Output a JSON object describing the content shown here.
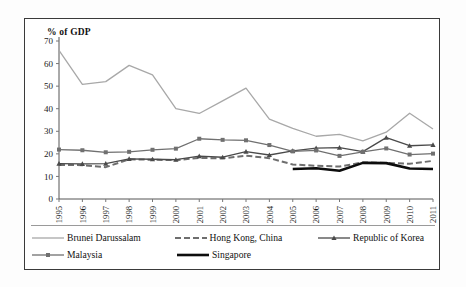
{
  "figure": {
    "axis_title": "% of GDP",
    "border_color": "#3a3a3a",
    "background": "#ffffff"
  },
  "chart_data": {
    "type": "line",
    "title": "",
    "subtitle": "",
    "xlabel": "",
    "ylabel": "% of GDP",
    "ylim": [
      0,
      70
    ],
    "ytick_step": 10,
    "yticks": [
      0,
      10,
      20,
      30,
      40,
      50,
      60,
      70
    ],
    "grid": false,
    "legend_position": "bottom",
    "categories": [
      "1995",
      "1996",
      "1997",
      "1998",
      "1999",
      "2000",
      "2001",
      "2002",
      "2003",
      "2004",
      "2005",
      "2006",
      "2007",
      "2008",
      "2009",
      "2010",
      "2011"
    ],
    "series": [
      {
        "name": "Brunei Darussalam",
        "color": "#a8a8a8",
        "style": "solid",
        "width": 1.3,
        "marker": "none",
        "values": [
          65.8,
          50.8,
          52.0,
          59.2,
          55.0,
          40.0,
          37.9,
          43.5,
          49.1,
          35.4,
          31.3,
          27.8,
          28.6,
          25.8,
          29.6,
          38.0,
          31.0
        ]
      },
      {
        "name": "Hong Kong, China",
        "color": "#6e6e6e",
        "style": "dashed",
        "width": 2.0,
        "marker": "none",
        "values": [
          15.1,
          15.0,
          14.1,
          17.6,
          17.4,
          17.2,
          18.2,
          18.0,
          19.2,
          18.1,
          15.3,
          14.7,
          14.4,
          16.2,
          16.0,
          15.6,
          16.9
        ]
      },
      {
        "name": "Republic of Korea",
        "color": "#4a4a4a",
        "style": "solid",
        "width": 1.3,
        "marker": "triangle",
        "values": [
          15.7,
          15.6,
          15.7,
          17.8,
          17.6,
          17.4,
          19.0,
          18.5,
          21.0,
          19.5,
          21.3,
          22.5,
          22.8,
          21.0,
          27.2,
          23.6,
          24.0
        ]
      },
      {
        "name": "Malaysia",
        "color": "#707070",
        "style": "solid",
        "width": 1.3,
        "marker": "square",
        "values": [
          21.9,
          21.6,
          20.7,
          20.9,
          21.8,
          22.3,
          26.7,
          26.2,
          26.0,
          23.9,
          21.1,
          21.5,
          19.1,
          20.9,
          22.4,
          19.7,
          20.1
        ]
      },
      {
        "name": "Singapore",
        "color": "#0d0d0d",
        "style": "solid",
        "width": 2.6,
        "marker": "none",
        "start_index": 10,
        "values": [
          null,
          null,
          null,
          null,
          null,
          null,
          null,
          null,
          null,
          null,
          13.3,
          13.6,
          12.5,
          16.0,
          15.9,
          13.5,
          13.3
        ]
      }
    ]
  },
  "legend": {
    "items": [
      {
        "label": "Brunei Darussalam",
        "swatch": "line-solid-light"
      },
      {
        "label": "Hong Kong, China",
        "swatch": "line-dashed-gray"
      },
      {
        "label": "Republic of Korea",
        "swatch": "line-solid-triangle"
      },
      {
        "label": "Malaysia",
        "swatch": "line-solid-square"
      },
      {
        "label": "Singapore",
        "swatch": "line-solid-thick-black"
      }
    ]
  }
}
